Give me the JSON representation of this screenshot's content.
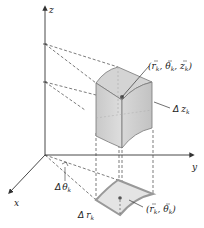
{
  "diagram": {
    "axes": {
      "z": "z",
      "y": "y",
      "x": "x"
    },
    "labels": {
      "point_3d": {
        "open": "(",
        "r": "r",
        "r_sub": "k",
        "theta": "θ",
        "theta_sub": "k",
        "z": "z",
        "z_sub": "k",
        "close": ")"
      },
      "delta_z": {
        "symbol": "Δ",
        "var": "z",
        "sub": "k"
      },
      "delta_theta": {
        "symbol": "Δ",
        "var": "θ",
        "sub": "k"
      },
      "delta_r": {
        "symbol": "Δ",
        "var": "r",
        "sub": "k"
      },
      "point_2d": {
        "open": "(",
        "r": "r",
        "r_sub": "k",
        "theta": "θ",
        "theta_sub": "k",
        "close": ")"
      }
    },
    "colors": {
      "line": "#333333",
      "solid_fill": "#cfcfcf",
      "base_fill": "#e4e4e4",
      "base_edge": "#9a9a9a"
    }
  }
}
